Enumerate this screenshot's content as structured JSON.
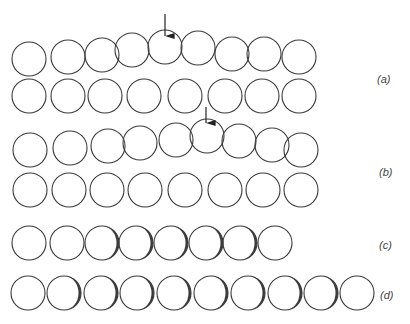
{
  "figure": {
    "type": "atomic-row-dislocation-diagram",
    "radius": 17,
    "stroke_color": "#3a3a3a",
    "shade_color": "#1a1a1a",
    "panels": [
      {
        "label": "(a)",
        "label_pos": [
          383,
          81
        ],
        "rows": [
          {
            "cy": [
              59,
              57,
              55,
              50,
              47,
              48,
              54,
              54,
              57
            ],
            "cx": [
              29,
              68,
              102,
              132,
              165,
              198,
              232,
              264,
              299
            ]
          },
          {
            "cy": [
              96,
              96,
              96,
              96,
              96,
              96,
              96,
              96
            ],
            "cx": [
              29,
              68,
              105,
              144,
              185,
              225,
              262,
              299
            ]
          }
        ],
        "arrow": {
          "x": 165,
          "y1": 14,
          "y2": 44
        }
      },
      {
        "label": "(b)",
        "label_pos": [
          385,
          174
        ],
        "rows": [
          {
            "cy": [
              150,
              148,
              146,
              143,
              140,
              136,
              141,
              145,
              150
            ],
            "cx": [
              30,
              70,
              108,
              140,
              176,
              207,
              239,
              272,
              301
            ]
          },
          {
            "cy": [
              190,
              190,
              190,
              190,
              190,
              190,
              190,
              190
            ],
            "cx": [
              30,
              69,
              107,
              145,
              185,
              225,
              263,
              301
            ]
          }
        ],
        "arrow": {
          "x": 206,
          "y1": 107,
          "y2": 131
        }
      },
      {
        "label": "(c)",
        "label_pos": [
          385,
          247
        ],
        "rows": [
          {
            "cy": [
              243,
              243,
              243,
              243,
              243,
              243,
              243,
              243
            ],
            "cx": [
              29,
              67,
              102,
              136,
              171,
              206,
              240,
              275
            ],
            "shaded": [
              false,
              false,
              true,
              true,
              true,
              true,
              true,
              false
            ]
          }
        ]
      },
      {
        "label": "(d)",
        "label_pos": [
          386,
          297
        ],
        "rows": [
          {
            "cy": [
              293,
              293,
              293,
              293,
              293,
              293,
              293,
              293,
              293,
              293
            ],
            "cx": [
              28,
              64,
              101,
              137,
              174,
              211,
              248,
              285,
              321,
              357
            ],
            "shaded": [
              false,
              true,
              true,
              true,
              true,
              true,
              true,
              true,
              true,
              false
            ]
          }
        ]
      }
    ]
  }
}
